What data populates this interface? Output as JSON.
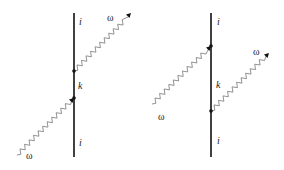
{
  "diagrams": [
    {
      "name": "left-feynman-diagram",
      "line": {
        "x": 74,
        "y1": 13,
        "y2": 157
      },
      "vertices": [
        {
          "x": 74,
          "y": 71
        },
        {
          "x": 74,
          "y": 98
        }
      ],
      "photons": [
        {
          "role": "incoming",
          "x1": 17,
          "y1": 155,
          "x2": 74,
          "y2": 98,
          "arrow": true
        },
        {
          "role": "outgoing",
          "x1": 74,
          "y1": 71,
          "x2": 130,
          "y2": 14,
          "arrow": true
        }
      ],
      "labels": {
        "top_state": "i",
        "intermediate_state": "k",
        "bottom_state": "i",
        "outgoing_photon": "ω",
        "incoming_photon": "ω"
      }
    },
    {
      "name": "right-feynman-diagram",
      "line": {
        "x": 211,
        "y1": 13,
        "y2": 157
      },
      "vertices": [
        {
          "x": 211,
          "y": 46
        },
        {
          "x": 211,
          "y": 111
        }
      ],
      "photons": [
        {
          "role": "incoming",
          "x1": 152,
          "y1": 104,
          "x2": 211,
          "y2": 46,
          "arrow": true
        },
        {
          "role": "outgoing",
          "x1": 211,
          "y1": 111,
          "x2": 268,
          "y2": 54,
          "arrow": true
        }
      ],
      "labels": {
        "top_state": "i",
        "intermediate_state": "k",
        "bottom_state": "i",
        "outgoing_photon": "ω",
        "incoming_photon": "ω"
      }
    }
  ],
  "colors": {
    "line": "#111111",
    "photon": "#777777",
    "text": "#222222"
  }
}
